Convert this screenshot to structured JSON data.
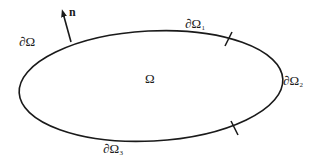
{
  "diagram": {
    "domain_label": "Ω",
    "boundary_label": "∂Ω",
    "normal_label": "n",
    "boundary_segments": [
      {
        "base": "∂Ω",
        "sub": "1"
      },
      {
        "base": "∂Ω",
        "sub": "2"
      },
      {
        "base": "∂Ω",
        "sub": "3"
      }
    ],
    "colors": {
      "stroke": "#1a1a1a",
      "background": "#ffffff"
    }
  }
}
